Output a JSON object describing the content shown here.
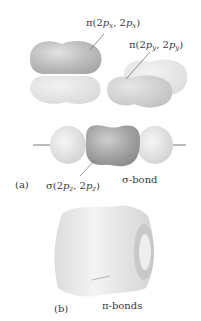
{
  "diagram": {
    "panel_a": {
      "tag": "(a)",
      "pi_x_label": {
        "prefix": "π(2",
        "p1": "p",
        "s1": "x",
        "mid": ", 2",
        "p2": "p",
        "s2": "x",
        "end": ")"
      },
      "pi_y_label": {
        "prefix": "π(2",
        "p1": "p",
        "s1": "y",
        "mid": ", 2",
        "p2": "p",
        "s2": "y",
        "end": ")"
      },
      "sigma_label": {
        "prefix": "σ(2",
        "p1": "p",
        "s1": "z",
        "mid": ", 2",
        "p2": "p",
        "s2": "z",
        "end": ")"
      },
      "sigma_bond_label": "σ-bond"
    },
    "panel_b": {
      "tag": "(b)",
      "pi_bonds_label": "π-bonds"
    },
    "colors": {
      "background": "#ffffff",
      "lobe_dark": "#b5b5b5",
      "lobe_light": "#e4e4e4",
      "sigma_center": "#9a9a9a",
      "axis_line": "#555555",
      "text": "#3a3a3a"
    }
  }
}
